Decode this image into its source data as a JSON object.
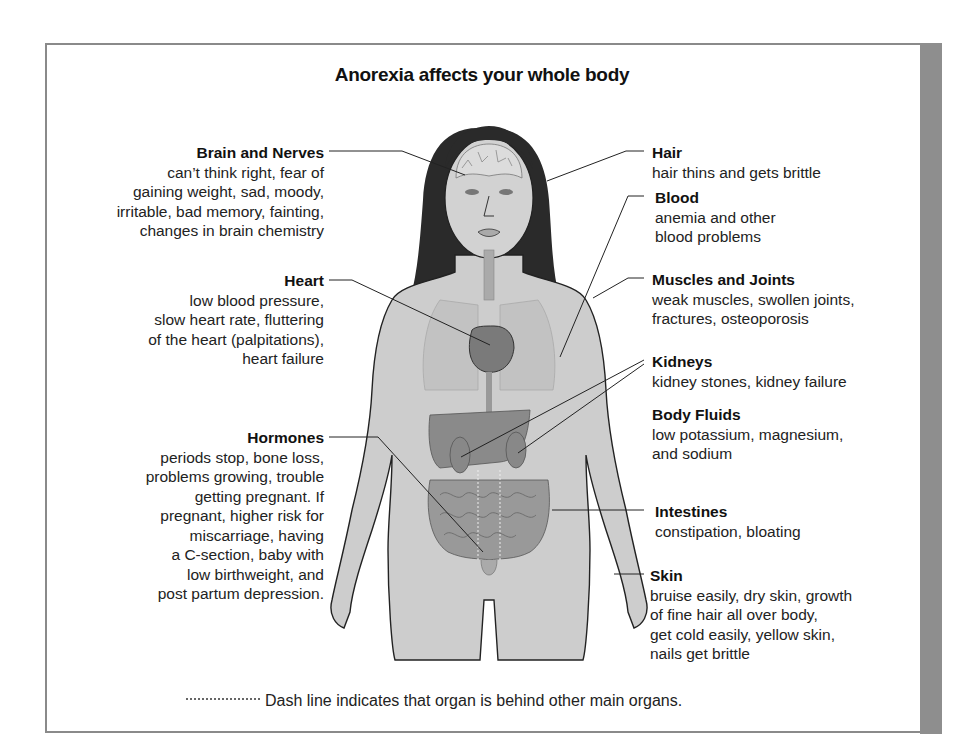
{
  "title": "Anorexia affects your whole body",
  "colors": {
    "frame": "#8a8a8a",
    "side_bar": "#8e8e8e",
    "skin": "#c9c9c9",
    "hair": "#2a2a2a",
    "organs": "#8c8c8c",
    "text": "#222222"
  },
  "labels_left": [
    {
      "heading": "Brain and Nerves",
      "lines": [
        "can’t think right, fear of",
        "gaining weight, sad, moody,",
        "irritable, bad memory, fainting,",
        "changes in brain chemistry"
      ]
    },
    {
      "heading": "Heart",
      "lines": [
        "low blood pressure,",
        "slow heart rate, fluttering",
        "of the heart (palpitations),",
        "heart failure"
      ]
    },
    {
      "heading": "Hormones",
      "lines": [
        "periods stop, bone loss,",
        "problems growing, trouble",
        "getting pregnant. If",
        "pregnant, higher risk for",
        "miscarriage, having",
        "a C-section, baby with",
        "low birthweight, and",
        "post partum depression."
      ]
    }
  ],
  "labels_right": [
    {
      "heading": "Hair",
      "lines": [
        "hair thins and gets brittle"
      ]
    },
    {
      "heading": "Blood",
      "lines": [
        "anemia and other",
        "blood problems"
      ]
    },
    {
      "heading": "Muscles and Joints",
      "lines": [
        "weak muscles, swollen joints,",
        "fractures, osteoporosis"
      ]
    },
    {
      "heading": "Kidneys",
      "lines": [
        "kidney stones, kidney failure"
      ]
    },
    {
      "heading": "Body Fluids",
      "lines": [
        "low potassium, magnesium,",
        "and sodium"
      ]
    },
    {
      "heading": "Intestines",
      "lines": [
        "constipation, bloating"
      ]
    },
    {
      "heading": "Skin",
      "lines": [
        "bruise easily, dry skin, growth",
        "of fine hair all over body,",
        "get cold easily, yellow skin,",
        "nails get brittle"
      ]
    }
  ],
  "legend": {
    "symbol": "dotted-line",
    "text": "Dash line indicates that organ is behind other main organs."
  }
}
